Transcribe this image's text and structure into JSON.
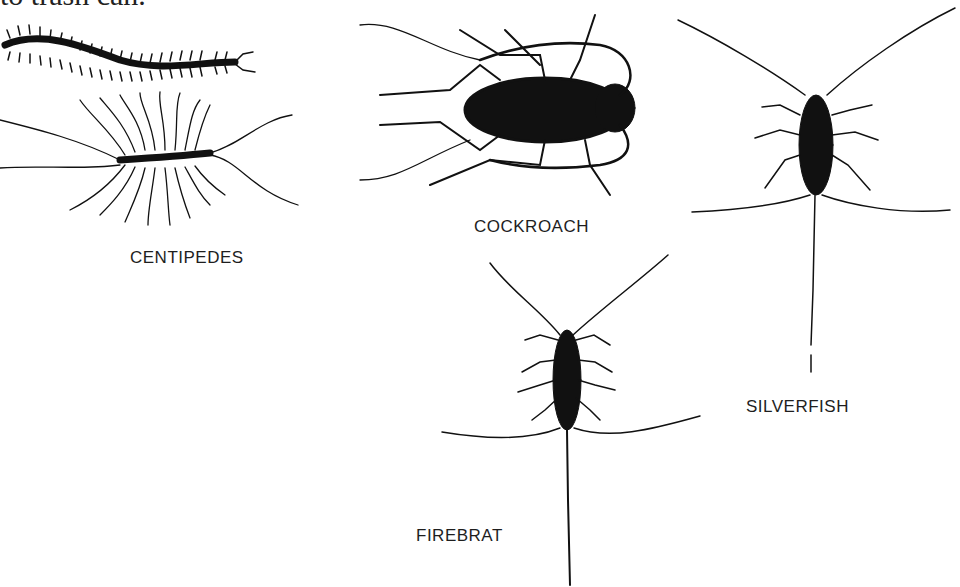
{
  "page": {
    "top_caption_fragment": "to trash can.",
    "figures": [
      {
        "id": "centipedes",
        "label": "CENTIPEDES"
      },
      {
        "id": "cockroach",
        "label": "COCKROACH"
      },
      {
        "id": "silverfish",
        "label": "SILVERFISH"
      },
      {
        "id": "firebrat",
        "label": "FIREBRAT"
      }
    ],
    "colors": {
      "ink": "#111111",
      "paper": "#ffffff"
    }
  }
}
